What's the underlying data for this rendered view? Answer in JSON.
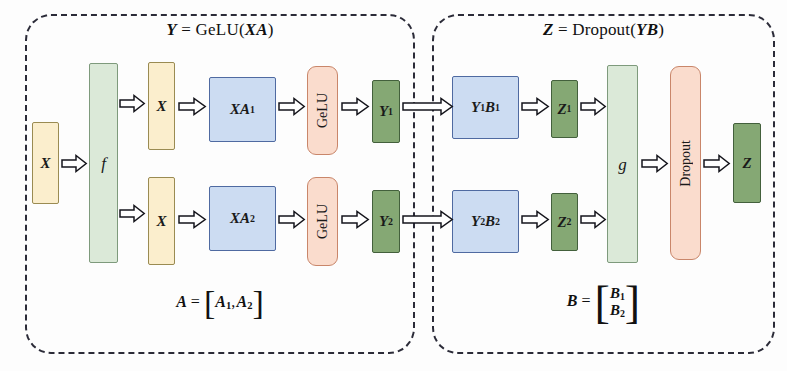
{
  "figure": {
    "background_color": "#fdfdfd"
  },
  "panels": [
    {
      "id": "left",
      "name": "gelu-panel",
      "title": "Y = GeLU(XA)",
      "title_parts": {
        "lhs": "Y",
        "eq": "=",
        "fn": "GeLU(",
        "arg": "XA",
        "close": ")"
      },
      "footer": "A = [A1, A2]",
      "footer_parts": {
        "lhs": "A",
        "eq": "=",
        "open": "[",
        "item1": "A",
        "sub1": "1",
        "comma": ",",
        "item2": "A",
        "sub2": "2",
        "close": "]"
      }
    },
    {
      "id": "right",
      "name": "dropout-panel",
      "title": "Z = Dropout(YB)",
      "title_parts": {
        "lhs": "Z",
        "eq": "=",
        "fn": "Dropout(",
        "arg": "YB",
        "close": ")"
      },
      "footer": "B = [B1; B2]",
      "footer_parts": {
        "lhs": "B",
        "eq": "=",
        "row1": "B",
        "sub1": "1",
        "row2": "B",
        "sub2": "2"
      }
    }
  ],
  "nodes": {
    "input_x": {
      "label": "X",
      "color": "cream",
      "role": "input-tensor"
    },
    "f_column": {
      "label": "f",
      "color": "mint",
      "role": "identity-forward-allreduce-backward"
    },
    "x_top": {
      "label": "X",
      "color": "cream",
      "role": "replicated-input"
    },
    "x_bottom": {
      "label": "X",
      "color": "cream",
      "role": "replicated-input"
    },
    "xa1": {
      "label": "XA",
      "sub": "1",
      "color": "blue",
      "role": "matmul-shard-1"
    },
    "xa2": {
      "label": "XA",
      "sub": "2",
      "color": "blue",
      "role": "matmul-shard-2"
    },
    "gelu_top": {
      "label": "GeLU",
      "color": "peach",
      "role": "activation"
    },
    "gelu_bottom": {
      "label": "GeLU",
      "color": "peach",
      "role": "activation"
    },
    "y1": {
      "label": "Y",
      "sub": "1",
      "color": "green",
      "role": "activation-output-shard-1"
    },
    "y2": {
      "label": "Y",
      "sub": "2",
      "color": "green",
      "role": "activation-output-shard-2"
    },
    "y1b1": {
      "label": "Y",
      "sub": "1",
      "label2": "B",
      "sub2": "1",
      "color": "blue",
      "role": "matmul-shard-1"
    },
    "y2b2": {
      "label": "Y",
      "sub": "2",
      "label2": "B",
      "sub2": "2",
      "color": "blue",
      "role": "matmul-shard-2"
    },
    "z1": {
      "label": "Z",
      "sub": "1",
      "color": "green",
      "role": "partial-output-shard-1"
    },
    "z2": {
      "label": "Z",
      "sub": "2",
      "color": "green",
      "role": "partial-output-shard-2"
    },
    "g_column": {
      "label": "g",
      "color": "mint",
      "role": "allreduce-forward-identity-backward"
    },
    "dropout": {
      "label": "Dropout",
      "color": "peach",
      "role": "dropout-layer"
    },
    "output_z": {
      "label": "Z",
      "color": "green",
      "role": "output-tensor"
    }
  },
  "colors": {
    "cream": "#fbeecd",
    "cream_border": "#9a8b52",
    "mint": "#dbe9d8",
    "mint_border": "#7e9a7c",
    "blue": "#ccdcf2",
    "blue_border": "#4f6aa1",
    "peach": "#fadccd",
    "peach_border": "#c9866a",
    "green": "#85a874",
    "green_border": "#43603c",
    "panel_border": "#2b2b38",
    "arrow_fill": "#ffffff",
    "arrow_stroke": "#15151c"
  },
  "arrows": [
    {
      "name": "arrow-x-to-f",
      "from": "input_x",
      "to": "f_column",
      "style": "single"
    },
    {
      "name": "arrow-f-to-x-top",
      "from": "f_column",
      "to": "x_top",
      "style": "single"
    },
    {
      "name": "arrow-f-to-x-bottom",
      "from": "f_column",
      "to": "x_bottom",
      "style": "single"
    },
    {
      "name": "arrow-x-top-to-xa1",
      "from": "x_top",
      "to": "xa1",
      "style": "single"
    },
    {
      "name": "arrow-x-bottom-to-xa2",
      "from": "x_bottom",
      "to": "xa2",
      "style": "single"
    },
    {
      "name": "arrow-xa1-to-gelu-top",
      "from": "xa1",
      "to": "gelu_top",
      "style": "single"
    },
    {
      "name": "arrow-xa2-to-gelu-bottom",
      "from": "xa2",
      "to": "gelu_bottom",
      "style": "single"
    },
    {
      "name": "arrow-gelu-top-to-y1",
      "from": "gelu_top",
      "to": "y1",
      "style": "single"
    },
    {
      "name": "arrow-gelu-bottom-to-y2",
      "from": "gelu_bottom",
      "to": "y2",
      "style": "single"
    },
    {
      "name": "arrow-y1-to-y1b1",
      "from": "y1",
      "to": "y1b1",
      "style": "double-long"
    },
    {
      "name": "arrow-y2-to-y2b2",
      "from": "y2",
      "to": "y2b2",
      "style": "double-long"
    },
    {
      "name": "arrow-y1b1-to-z1",
      "from": "y1b1",
      "to": "z1",
      "style": "single"
    },
    {
      "name": "arrow-y2b2-to-z2",
      "from": "y2b2",
      "to": "z2",
      "style": "single"
    },
    {
      "name": "arrow-z1-to-g",
      "from": "z1",
      "to": "g_column",
      "style": "single"
    },
    {
      "name": "arrow-z2-to-g",
      "from": "z2",
      "to": "g_column",
      "style": "single"
    },
    {
      "name": "arrow-g-to-dropout",
      "from": "g_column",
      "to": "dropout",
      "style": "single"
    },
    {
      "name": "arrow-dropout-to-z",
      "from": "dropout",
      "to": "output_z",
      "style": "single"
    }
  ]
}
